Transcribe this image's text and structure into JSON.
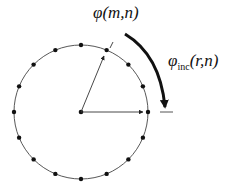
{
  "diagram": {
    "labels": {
      "phi_mn": {
        "symbol": "φ",
        "args": "(m,n)"
      },
      "phi_inc": {
        "symbol": "φ",
        "subscript": "inc",
        "args": "(r,n)"
      }
    },
    "circle": {
      "cx": 81,
      "cy": 112,
      "r": 67,
      "num_points": 16
    },
    "colors": {
      "stroke": "#333333",
      "dot": "#111111",
      "arrow": "#111111"
    }
  }
}
